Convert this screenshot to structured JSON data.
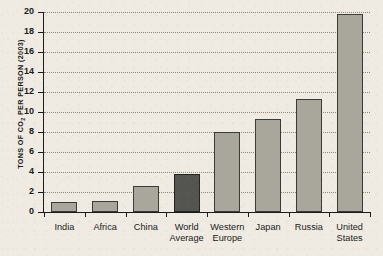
{
  "chart_data": {
    "type": "bar",
    "title": "",
    "xlabel": "",
    "ylabel": "TONS OF CO2 PER PERSON (2003)",
    "ylabel_parts": {
      "pre": "TONS OF CO",
      "sub": "2",
      "post": " PER PERSON (2003)"
    },
    "categories": [
      "India",
      "Africa",
      "China",
      "World Average",
      "Western Europe",
      "Japan",
      "Russia",
      "United States"
    ],
    "category_lines": [
      [
        "India"
      ],
      [
        "Africa"
      ],
      [
        "China"
      ],
      [
        "World",
        "Average"
      ],
      [
        "Western",
        "Europe"
      ],
      [
        "Japan"
      ],
      [
        "Russia"
      ],
      [
        "United",
        "States"
      ]
    ],
    "values": [
      1.0,
      1.1,
      2.6,
      3.8,
      8.0,
      9.3,
      11.3,
      19.8
    ],
    "ylim": [
      0,
      20
    ],
    "yticks": [
      0,
      2,
      4,
      6,
      8,
      10,
      12,
      14,
      16,
      18,
      20
    ],
    "ytick_labels": [
      "0",
      "2",
      "4",
      "6",
      "8",
      "10",
      "12",
      "14",
      "16",
      "18",
      "20"
    ],
    "grid": true,
    "grid_style": "dotted-horizontal",
    "legend": "none",
    "highlight_index": 3,
    "colors": {
      "background": "#efebe2",
      "bar": "#a9a79c",
      "bar_highlight": "#545450",
      "bar_outline": "#3a3a38",
      "axis": "#1a1a1a",
      "grid": "#8d8879",
      "text": "#1a1a1a"
    }
  }
}
